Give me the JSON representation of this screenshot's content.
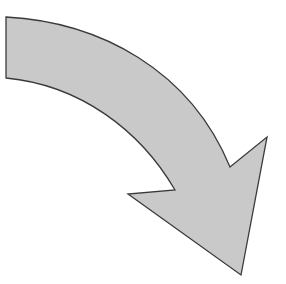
{
  "figure": {
    "colors": {
      "background": "#ffffff",
      "fill": "#c9c9c9",
      "stroke": "#3a3a3a"
    }
  }
}
